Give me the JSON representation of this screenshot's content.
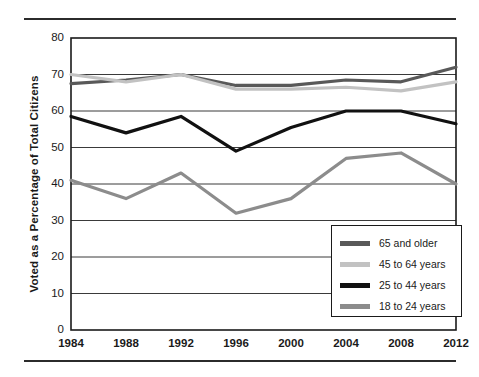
{
  "figure": {
    "has_top_rule": true,
    "has_bottom_rule": true,
    "background": "#ffffff"
  },
  "legend": {
    "position": "inside-bottom-right",
    "entries": [
      {
        "label": "65 and older",
        "color": "#595959",
        "swatch": "legend-swatch-65-and-older"
      },
      {
        "label": "45 to 64 years",
        "color": "#c2c2c2",
        "swatch": "legend-swatch-45-to-64-years"
      },
      {
        "label": "25 to 44 years",
        "color": "#111111",
        "swatch": "legend-swatch-25-to-44-years"
      },
      {
        "label": "18 to 24 years",
        "color": "#8c8c8c",
        "swatch": "legend-swatch-18-to-24-years"
      }
    ]
  },
  "axes": {
    "y_title": "Voted as a Percentage of Total Citizens",
    "y_ticks": [
      "80",
      "70",
      "60",
      "50",
      "40",
      "30",
      "20",
      "10",
      "0"
    ],
    "x_ticks": [
      "1984",
      "1988",
      "1992",
      "1996",
      "2000",
      "2004",
      "2008",
      "2012"
    ]
  },
  "chart_data": {
    "type": "line",
    "title": "",
    "xlabel": "",
    "ylabel": "Voted as a Percentage of Total Citizens",
    "x": [
      1984,
      1988,
      1992,
      1996,
      2000,
      2004,
      2008,
      2012
    ],
    "categories": [
      "1984",
      "1988",
      "1992",
      "1996",
      "2000",
      "2004",
      "2008",
      "2012"
    ],
    "xlim": [
      1984,
      2012
    ],
    "ylim": [
      0,
      80
    ],
    "ytick_step": 10,
    "grid": true,
    "grid_axis": "y",
    "legend_position": "lower right",
    "series": [
      {
        "name": "65 and older",
        "color": "#595959",
        "values": [
          67.5,
          68.5,
          70.0,
          67.0,
          67.0,
          68.5,
          68.0,
          72.0
        ]
      },
      {
        "name": "45 to 64 years",
        "color": "#c2c2c2",
        "values": [
          70.0,
          68.0,
          70.0,
          66.0,
          66.0,
          66.5,
          65.5,
          68.0
        ]
      },
      {
        "name": "25 to 44 years",
        "color": "#111111",
        "values": [
          58.5,
          54.0,
          58.5,
          49.0,
          55.5,
          60.0,
          60.0,
          56.5
        ]
      },
      {
        "name": "18 to 24 years",
        "color": "#8c8c8c",
        "values": [
          41.0,
          36.0,
          43.0,
          32.0,
          36.0,
          47.0,
          48.5,
          40.0
        ]
      }
    ]
  }
}
